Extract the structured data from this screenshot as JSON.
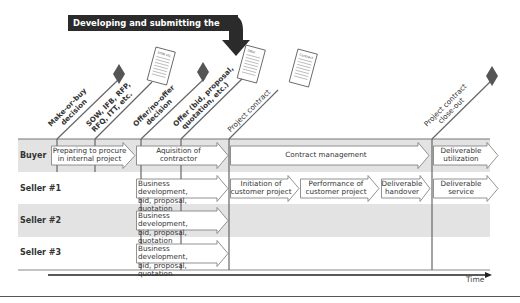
{
  "banner": {
    "text": "Developing and submitting the offer"
  },
  "lanes": [
    {
      "label": "Buyer"
    },
    {
      "label": "Seller #1"
    },
    {
      "label": "Seller #2"
    },
    {
      "label": "Seller #3"
    }
  ],
  "milestones": [
    {
      "label_line1": "Make-or-buy",
      "label_line2": "decision",
      "marker": "diamond-icon"
    },
    {
      "label_line1": "SOW, IFB, RFP,",
      "label_line2": "RFQ, ITT, etc.",
      "marker": "document-icon",
      "doc_label": "SOW etc."
    },
    {
      "label_line1": "Offer/no-offer",
      "label_line2": "decision",
      "marker": "diamond-icon"
    },
    {
      "label_line1": "Offer (bid, proposal,",
      "label_line2": "quotation, etc.)",
      "marker": "document-icon",
      "doc_label": "Offer"
    },
    {
      "label_line1": "Project contract",
      "label_line2": "",
      "marker": "document-icon",
      "doc_label": "Contract"
    },
    {
      "label_line1": "Project contract",
      "label_line2": "close-out",
      "marker": "diamond-icon"
    }
  ],
  "phases": {
    "buyer": [
      {
        "line1": "Preparing to procure",
        "line2": "in internal project"
      },
      {
        "line1": "Aquisition of",
        "line2": "contractor"
      },
      {
        "line1": "Contract management",
        "line2": ""
      },
      {
        "line1": "Deliverable",
        "line2": "utilization"
      }
    ],
    "seller1": [
      {
        "line1": "Business development,",
        "line2": "bid, proposal, quotation"
      },
      {
        "line1": "Initiation of",
        "line2": "customer project"
      },
      {
        "line1": "Performance of",
        "line2": "customer project"
      },
      {
        "line1": "Deliverable",
        "line2": "handover"
      },
      {
        "line1": "Deliverable",
        "line2": "service"
      }
    ],
    "seller2": [
      {
        "line1": "Business development,",
        "line2": "bid, proposal, quotation"
      }
    ],
    "seller3": [
      {
        "line1": "Business development,",
        "line2": "bid, proposal, quotation"
      }
    ]
  },
  "axis": {
    "label": "Time"
  },
  "colors": {
    "lane_gray": "#e3e3e3",
    "banner": "#2b2b2b",
    "diamond": "#555555",
    "line": "#666666"
  }
}
